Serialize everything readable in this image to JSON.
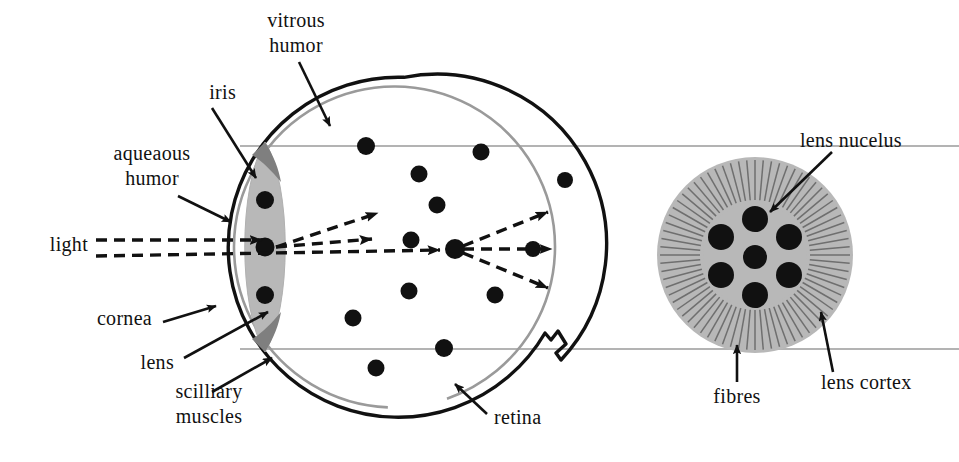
{
  "figure": {
    "background_color": "#ffffff",
    "ink_color": "#111111",
    "lens_fill_color": "#b8b8b8",
    "iris_fill_color": "#8a8a8a",
    "retina_line_color": "#9a9a9a",
    "connector_line_color": "#9a9a9a"
  },
  "labels": {
    "vitrous_humor": "vitrous\nhumor",
    "iris": "iris",
    "aqueaous_humor": "aqueaous\nhumor",
    "light": "light",
    "cornea": "cornea",
    "lens": "lens",
    "scilliary_muscles": "scilliary\nmuscles",
    "retina": "retina",
    "lens_nucelus": "lens nucelus",
    "fibres": "fibres",
    "lens_cortex": "lens cortex"
  },
  "eyeball": {
    "center_x": 395,
    "center_y": 247,
    "radius": 170,
    "outline_width": 3.5,
    "retina_inner_offset": 9,
    "optic_nerve_notch": "right"
  },
  "lens_in_eye": {
    "center_x": 265,
    "center_y": 247,
    "half_width": 25,
    "half_height": 105,
    "nuclei_count": 3,
    "nuclei_y": [
      200,
      247,
      295
    ]
  },
  "light_rays": {
    "incoming_count": 2,
    "incoming_y": [
      240,
      256
    ],
    "focal_point_x": 455,
    "focal_point_y": 249,
    "outgoing_count": 3,
    "description": "parallel rays refracted by lens converge at focal point then diverge toward retina"
  },
  "vitreous_particles": {
    "count": 14,
    "points": [
      [
        366,
        146
      ],
      [
        481,
        152
      ],
      [
        419,
        174
      ],
      [
        565,
        180
      ],
      [
        437,
        205
      ],
      [
        411,
        240
      ],
      [
        455,
        249
      ],
      [
        533,
        249
      ],
      [
        409,
        291
      ],
      [
        495,
        295
      ],
      [
        353,
        318
      ],
      [
        444,
        348
      ],
      [
        376,
        368
      ],
      [
        349,
        204
      ]
    ]
  },
  "magnified_lens": {
    "center_x": 755,
    "center_y": 255,
    "outer_radius": 98,
    "nucleus_radius": 52,
    "fibre_count": 72,
    "nuclei_count": 7,
    "nuclei_offsets": [
      [
        0,
        -36
      ],
      [
        -34,
        -18
      ],
      [
        34,
        -18
      ],
      [
        -34,
        20
      ],
      [
        0,
        2
      ],
      [
        34,
        20
      ],
      [
        0,
        40
      ]
    ]
  },
  "connectors": {
    "top_y": 146,
    "bottom_y": 349,
    "from_x": 240,
    "to_x": 959
  }
}
